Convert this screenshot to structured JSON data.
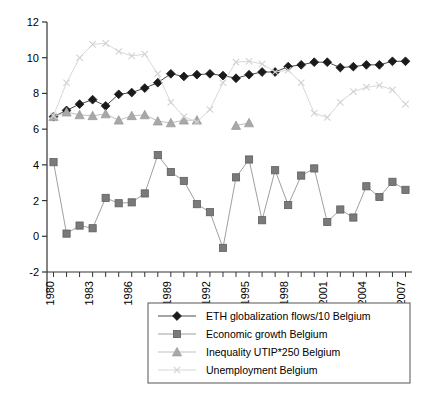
{
  "chart_data": {
    "type": "line",
    "title": "",
    "subtitle": "",
    "xlabel": "",
    "ylabel": "",
    "xlim": [
      1979.5,
      2007.5
    ],
    "ylim": [
      -2,
      12
    ],
    "yticks": [
      -2,
      0,
      2,
      4,
      6,
      8,
      10,
      12
    ],
    "ytick_labels": [
      "-2",
      "0",
      "2",
      "4",
      "6",
      "8",
      "10",
      "12"
    ],
    "x": [
      1980,
      1981,
      1982,
      1983,
      1984,
      1985,
      1986,
      1987,
      1988,
      1989,
      1990,
      1991,
      1992,
      1993,
      1994,
      1995,
      1996,
      1997,
      1998,
      1999,
      2000,
      2001,
      2002,
      2003,
      2004,
      2005,
      2006,
      2007
    ],
    "xtick_labels": [
      "1980",
      "1983",
      "1986",
      "1989",
      "1992",
      "1995",
      "1998",
      "2001",
      "2004",
      "2007"
    ],
    "xticks_major": [
      1980,
      1983,
      1986,
      1989,
      1992,
      1995,
      1998,
      2001,
      2004,
      2007
    ],
    "grid": false,
    "legend_position": "below",
    "series": [
      {
        "name": "ETH globalization flows/10 Belgium",
        "marker": "diamond",
        "color": "#1a1a1a",
        "line_color": "#4d4d4d",
        "values": [
          6.7,
          7.05,
          7.4,
          7.65,
          7.3,
          7.95,
          8.05,
          8.3,
          8.6,
          9.1,
          8.95,
          9.05,
          9.1,
          9.0,
          8.85,
          9.05,
          9.2,
          9.2,
          9.5,
          9.6,
          9.75,
          9.75,
          9.45,
          9.5,
          9.6,
          9.6,
          9.8,
          9.8
        ]
      },
      {
        "name": "Economic growth Belgium",
        "marker": "square",
        "color": "#7a7a7a",
        "line_color": "#a0a0a0",
        "values": [
          4.15,
          0.15,
          0.6,
          0.45,
          2.15,
          1.85,
          1.9,
          2.4,
          4.55,
          3.6,
          3.1,
          1.8,
          1.35,
          -0.65,
          3.3,
          4.3,
          0.9,
          3.7,
          1.75,
          3.4,
          3.8,
          0.8,
          1.5,
          1.05,
          2.8,
          2.2,
          3.05,
          2.6
        ]
      },
      {
        "name": "Inequality UTIP*250 Belgium",
        "marker": "triangle",
        "color": "#a8a8a8",
        "line_color": "#c0c0c0",
        "values": [
          6.7,
          6.95,
          6.8,
          6.75,
          6.85,
          6.5,
          6.75,
          6.8,
          6.45,
          6.35,
          6.5,
          6.5,
          null,
          null,
          6.2,
          6.35,
          null,
          null,
          null,
          null,
          null,
          null,
          null,
          null,
          null,
          null,
          null,
          null
        ]
      },
      {
        "name": "Unemployment Belgium",
        "marker": "x",
        "color": "#d2d2d2",
        "line_color": "#d8d8d8",
        "values": [
          6.75,
          8.6,
          10.0,
          10.75,
          10.8,
          10.35,
          10.1,
          10.2,
          9.1,
          7.5,
          6.7,
          6.4,
          7.1,
          8.6,
          9.75,
          9.8,
          9.65,
          9.2,
          9.3,
          8.6,
          6.9,
          6.65,
          7.5,
          8.1,
          8.35,
          8.45,
          8.2,
          7.4
        ]
      }
    ]
  },
  "legend": {
    "entries": [
      {
        "label": "ETH globalization flows/10 Belgium",
        "marker": "diamond-marker-icon"
      },
      {
        "label": "Economic growth Belgium",
        "marker": "square-marker-icon"
      },
      {
        "label": "Inequality UTIP*250 Belgium",
        "marker": "triangle-marker-icon"
      },
      {
        "label": "Unemployment Belgium",
        "marker": "x-marker-icon"
      }
    ]
  }
}
